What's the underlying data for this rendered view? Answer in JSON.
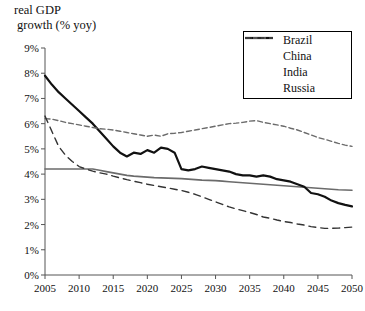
{
  "chart_data": {
    "type": "line",
    "title": "real GDP growth (% yoy)",
    "title_line1": "real GDP",
    "title_line2": "growth (% yoy)",
    "xlabel": "",
    "ylabel": "",
    "xlim": [
      2005,
      2050
    ],
    "ylim": [
      0,
      9
    ],
    "grid": false,
    "legend_position": "top-right",
    "ytick_labels": [
      "0%",
      "1%",
      "2%",
      "3%",
      "4%",
      "5%",
      "6%",
      "7%",
      "8%",
      "9%"
    ],
    "ytick_values": [
      0,
      1,
      2,
      3,
      4,
      5,
      6,
      7,
      8,
      9
    ],
    "xtick_labels": [
      "2005",
      "2010",
      "2015",
      "2020",
      "2025",
      "2030",
      "2035",
      "2040",
      "2045",
      "2050"
    ],
    "xtick_values": [
      2005,
      2010,
      2015,
      2020,
      2025,
      2030,
      2035,
      2040,
      2045,
      2050
    ],
    "x": [
      2005,
      2006,
      2007,
      2008,
      2009,
      2010,
      2011,
      2012,
      2013,
      2014,
      2015,
      2016,
      2017,
      2018,
      2019,
      2020,
      2021,
      2022,
      2023,
      2024,
      2025,
      2026,
      2027,
      2028,
      2029,
      2030,
      2031,
      2032,
      2033,
      2034,
      2035,
      2036,
      2037,
      2038,
      2039,
      2040,
      2041,
      2042,
      2043,
      2044,
      2045,
      2046,
      2047,
      2048,
      2049,
      2050
    ],
    "series": [
      {
        "name": "Brazil",
        "color": "#6b6b6b",
        "style": "solid",
        "width": 1.6,
        "values": [
          4.2,
          4.2,
          4.2,
          4.2,
          4.2,
          4.2,
          4.2,
          4.2,
          4.15,
          4.1,
          4.05,
          4.0,
          3.95,
          3.92,
          3.9,
          3.88,
          3.86,
          3.85,
          3.84,
          3.83,
          3.82,
          3.8,
          3.78,
          3.76,
          3.75,
          3.74,
          3.72,
          3.7,
          3.68,
          3.66,
          3.64,
          3.62,
          3.6,
          3.58,
          3.56,
          3.54,
          3.52,
          3.5,
          3.48,
          3.46,
          3.44,
          3.42,
          3.4,
          3.38,
          3.37,
          3.36
        ]
      },
      {
        "name": "China",
        "color": "#111111",
        "style": "solid",
        "width": 2.2,
        "values": [
          7.9,
          7.55,
          7.25,
          7.0,
          6.75,
          6.5,
          6.25,
          6.0,
          5.7,
          5.4,
          5.1,
          4.85,
          4.7,
          4.85,
          4.8,
          4.95,
          4.85,
          5.05,
          5.0,
          4.85,
          4.2,
          4.15,
          4.2,
          4.3,
          4.25,
          4.2,
          4.15,
          4.1,
          4.0,
          3.95,
          3.95,
          3.9,
          3.95,
          3.9,
          3.8,
          3.75,
          3.7,
          3.6,
          3.5,
          3.25,
          3.2,
          3.1,
          2.95,
          2.85,
          2.78,
          2.72
        ]
      },
      {
        "name": "India",
        "color": "#6b6b6b",
        "style": "dashed-short",
        "width": 1.4,
        "values": [
          6.2,
          6.18,
          6.12,
          6.05,
          6.0,
          5.95,
          5.9,
          5.85,
          5.8,
          5.78,
          5.75,
          5.7,
          5.65,
          5.6,
          5.55,
          5.5,
          5.55,
          5.5,
          5.6,
          5.62,
          5.65,
          5.7,
          5.75,
          5.8,
          5.85,
          5.9,
          5.95,
          6.0,
          6.02,
          6.05,
          6.1,
          6.12,
          6.05,
          6.0,
          5.95,
          5.9,
          5.82,
          5.75,
          5.65,
          5.55,
          5.45,
          5.38,
          5.3,
          5.22,
          5.15,
          5.1
        ]
      },
      {
        "name": "Russia",
        "color": "#333333",
        "style": "dashed-long",
        "width": 1.4,
        "values": [
          6.3,
          5.7,
          5.1,
          4.75,
          4.5,
          4.3,
          4.2,
          4.12,
          4.05,
          4.0,
          3.92,
          3.85,
          3.78,
          3.72,
          3.66,
          3.6,
          3.55,
          3.5,
          3.45,
          3.4,
          3.35,
          3.28,
          3.2,
          3.1,
          3.0,
          2.9,
          2.8,
          2.7,
          2.62,
          2.55,
          2.48,
          2.4,
          2.3,
          2.25,
          2.18,
          2.12,
          2.08,
          2.02,
          1.98,
          1.92,
          1.88,
          1.85,
          1.85,
          1.86,
          1.88,
          1.9
        ]
      }
    ]
  },
  "legend": {
    "items": [
      {
        "label": "Brazil"
      },
      {
        "label": "China"
      },
      {
        "label": "India"
      },
      {
        "label": "Russia"
      }
    ]
  }
}
